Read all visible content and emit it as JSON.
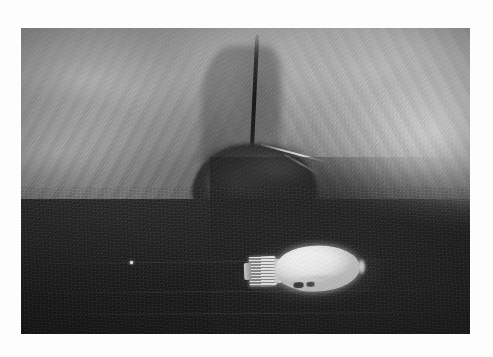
{
  "document": {
    "background_color": "#fdfdfd",
    "kind": "photograph",
    "alt_text": "Black and white photograph of a rough rock cave interior with a dark triangular recess, and a glowing incandescent light bulb lying on its side on the dark cave floor"
  },
  "photo": {
    "label": "cave interior photograph",
    "frame": {
      "left": 21,
      "top": 28,
      "width": 449,
      "height": 306
    },
    "palette": {
      "highlight": "#ffffff",
      "rock_light": "#c8c8c8",
      "rock_mid": "#8e8e8e",
      "rock_dark": "#4a4a4a",
      "floor_dark": "#1d1d1d",
      "recess_dark": "#2a2a2a",
      "bulb_glass": "#fdfdfd",
      "bulb_base_metal": "#8e8e8e"
    },
    "subjects": [
      {
        "name": "rock-wall-left",
        "description": "Grainy mid-gray rock mass with diagonal ridges sloping down to the right"
      },
      {
        "name": "rock-wall-right",
        "description": "Brighter striated rock wall curving down toward the center"
      },
      {
        "name": "central-fissure",
        "description": "Dark vertical crack running from the top edge down to the cave opening"
      },
      {
        "name": "cave-recess",
        "description": "Dark arched opening with crumpled lighter rock inside and a pale streak across its top"
      },
      {
        "name": "cave-floor",
        "description": "Very dark foreground floor sloping from lower-left up to the right"
      },
      {
        "name": "light-bulb",
        "description": "Glowing incandescent light bulb lying horizontally, glass envelope facing right, ribbed screw base at left"
      },
      {
        "name": "floor-speck",
        "description": "Small bright speck on the dark floor at the left of the bulb"
      }
    ]
  }
}
